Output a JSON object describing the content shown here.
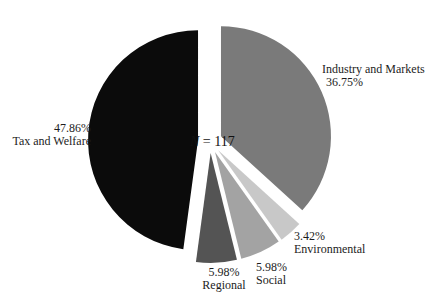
{
  "chart_data": {
    "type": "pie",
    "title": "",
    "sample_size_annotation": "N = 117",
    "center_label": {
      "symbol": "N",
      "rest": " = 117"
    },
    "start_angle_deg": 0,
    "direction": "clockwise",
    "slices": [
      {
        "label": "Industry and Markets",
        "value": 36.75,
        "pct_label": "36.75%",
        "color": "#7a7a7a"
      },
      {
        "label": "Environmental",
        "value": 3.42,
        "pct_label": "3.42%",
        "color": "#c8c8c8"
      },
      {
        "label": "Social",
        "value": 5.98,
        "pct_label": "5.98%",
        "color": "#a3a3a3"
      },
      {
        "label": "Regional",
        "value": 5.98,
        "pct_label": "5.98%",
        "color": "#545454"
      },
      {
        "label": "Tax and Welfare",
        "value": 47.86,
        "pct_label": "47.86%",
        "color": "#0b0b0b"
      }
    ],
    "layout": {
      "cx": 210,
      "cy": 141,
      "radius": 110,
      "explode": 12,
      "legend": "none",
      "labels": "outside",
      "background": "#ffffff"
    }
  }
}
